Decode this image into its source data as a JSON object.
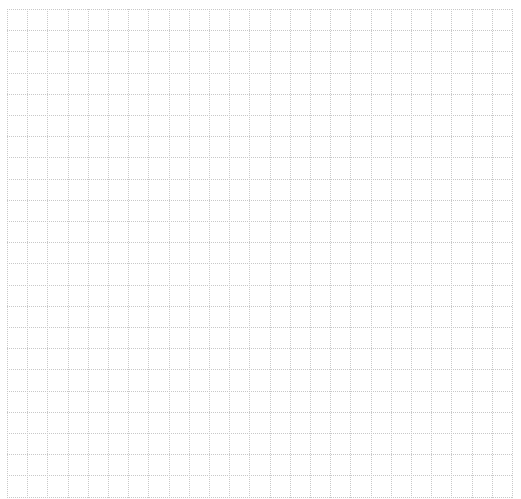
{
  "grid": {
    "left": 7,
    "top": 9,
    "right": 512,
    "bottom": 499,
    "columns": 25,
    "rows": 23,
    "line_color": "#c8c8c8",
    "background": "#ffffff"
  }
}
